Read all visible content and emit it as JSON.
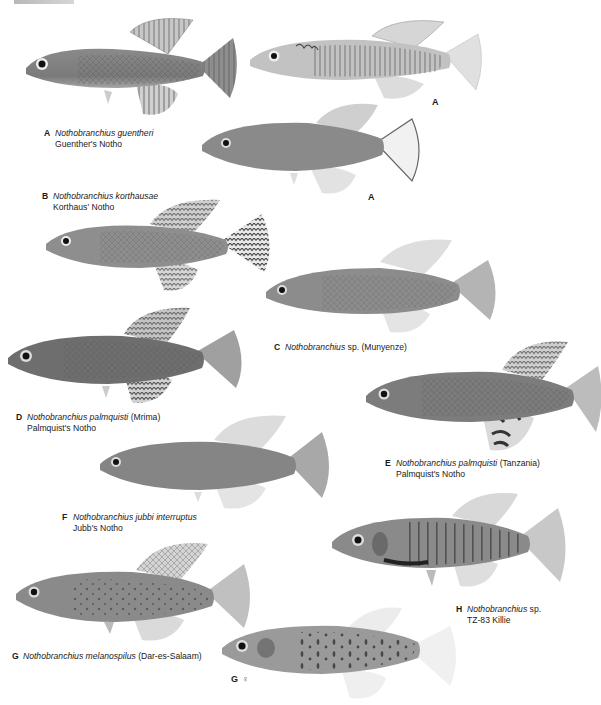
{
  "page": {
    "background": "#ffffff",
    "header_fragment": "text cut off at top edge"
  },
  "captions": [
    {
      "letter": "A",
      "scientific": "Nothobranchius guentheri",
      "qualifier": "",
      "common": "Guenther's Notho"
    },
    {
      "letter": "B",
      "scientific": "Nothobranchius korthausae",
      "qualifier": "",
      "common": "Korthaus' Notho"
    },
    {
      "letter": "C",
      "scientific": "Nothobranchius",
      "qualifier": " sp. (Munyenze)",
      "common": ""
    },
    {
      "letter": "D",
      "scientific": "Nothobranchius palmquisti",
      "qualifier": " (Mrima)",
      "common": "Palmquist's Notho"
    },
    {
      "letter": "E",
      "scientific": "Nothobranchius palmquisti",
      "qualifier": " (Tanzania)",
      "common": "Palmquist's Notho"
    },
    {
      "letter": "F",
      "scientific": "Nothobranchius jubbi interruptus",
      "qualifier": "",
      "common": "Jubb's Notho"
    },
    {
      "letter": "G",
      "scientific": "Nothobranchius melanospilus",
      "qualifier": " (Dar-es-Salaam)",
      "common": ""
    },
    {
      "letter": "H",
      "scientific": "Nothobranchius",
      "qualifier": " sp.",
      "common": "TZ-83 Killie"
    }
  ],
  "tags": {
    "a_female_1": "A",
    "a_female_2": "A",
    "g_female": "G",
    "female_symbol": "♀"
  },
  "fish": [
    {
      "id": "A-male",
      "tone": "#7a7a7a",
      "pattern": "reticulated"
    },
    {
      "id": "A-female-1",
      "tone": "#bdbdbd",
      "pattern": "barred"
    },
    {
      "id": "A-female-2",
      "tone": "#8a8a8a",
      "pattern": "plain"
    },
    {
      "id": "B",
      "tone": "#909090",
      "pattern": "barred-tail"
    },
    {
      "id": "C",
      "tone": "#8c8c8c",
      "pattern": "plain"
    },
    {
      "id": "D",
      "tone": "#6e6e6e",
      "pattern": "reticulated"
    },
    {
      "id": "E",
      "tone": "#7c7c7c",
      "pattern": "reticulated"
    },
    {
      "id": "F",
      "tone": "#858585",
      "pattern": "plain"
    },
    {
      "id": "G-male",
      "tone": "#8a8a8a",
      "pattern": "spotted"
    },
    {
      "id": "G-female",
      "tone": "#9a9a9a",
      "pattern": "spotted"
    },
    {
      "id": "H",
      "tone": "#8a8a8a",
      "pattern": "barred"
    }
  ]
}
